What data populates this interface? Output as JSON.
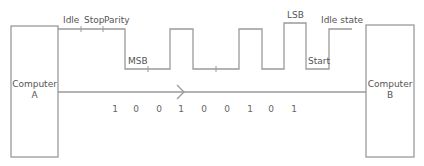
{
  "diagram": {
    "colors": {
      "line": "#9a9a9a",
      "text": "#555555",
      "background": "#ffffff"
    },
    "nodes": {
      "computer_a": {
        "line1": "Computer",
        "line2": "A"
      },
      "computer_b": {
        "line1": "Computer",
        "line2": "B"
      }
    },
    "waveform_labels": {
      "idle": "Idle",
      "stop": "Stop",
      "parity": "Parity",
      "msb": "MSB",
      "lsb": "LSB",
      "start": "Start",
      "idle_state": "Idle state"
    },
    "bits": [
      "1",
      "0",
      "0",
      "1",
      "0",
      "0",
      "1",
      "0",
      "1"
    ],
    "direction_icon": "chevron-right-arrow"
  }
}
